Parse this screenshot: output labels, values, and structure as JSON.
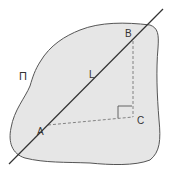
{
  "diagram": {
    "plane_label": "Π",
    "line_label": "L",
    "points": {
      "A": {
        "label": "A",
        "x": 48,
        "y": 125
      },
      "B": {
        "label": "B",
        "x": 132,
        "y": 41
      },
      "C": {
        "label": "C",
        "x": 133,
        "y": 117
      }
    },
    "colors": {
      "plane_fill": "#e6e6e6",
      "plane_stroke": "#555555",
      "line": "#333333",
      "dashed": "#777777",
      "background": "#ffffff"
    }
  }
}
